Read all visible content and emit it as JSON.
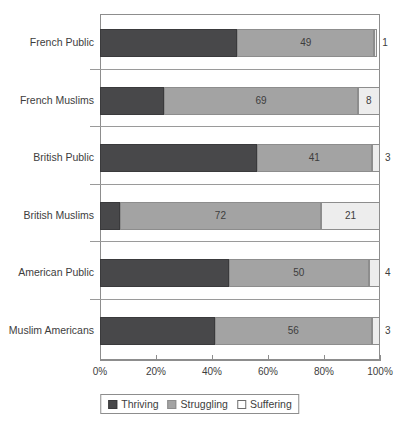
{
  "chart_data": {
    "type": "bar",
    "orientation": "horizontal",
    "stacked": true,
    "normalized_percent": true,
    "title": "",
    "subtitle": "",
    "xlabel": "",
    "ylabel": "",
    "xlim": [
      0,
      100
    ],
    "grid": false,
    "legend_position": "bottom",
    "categories": [
      "French Public",
      "French Muslims",
      "British Public",
      "British Muslims",
      "American Public",
      "Muslim Americans"
    ],
    "series": [
      {
        "name": "Thriving",
        "color": "#48484a",
        "values": [
          49,
          23,
          56,
          7,
          46,
          41
        ]
      },
      {
        "name": "Struggling",
        "color": "#a3a3a3",
        "values": [
          49,
          69,
          41,
          72,
          50,
          56
        ]
      },
      {
        "name": "Suffering",
        "color": "#ededed",
        "values": [
          1,
          8,
          3,
          21,
          4,
          3
        ]
      }
    ],
    "data_labels": {
      "French Public": {
        "Thriving": "",
        "Struggling": "49",
        "Suffering": "1"
      },
      "French Muslims": {
        "Thriving": "",
        "Struggling": "69",
        "Suffering": "8"
      },
      "British Public": {
        "Thriving": "",
        "Struggling": "41",
        "Suffering": "3"
      },
      "British Muslims": {
        "Thriving": "",
        "Struggling": "72",
        "Suffering": "21"
      },
      "American Public": {
        "Thriving": "",
        "Struggling": "50",
        "Suffering": "4"
      },
      "Muslim Americans": {
        "Thriving": "",
        "Struggling": "56",
        "Suffering": "3"
      }
    },
    "xticks": [
      0,
      20,
      40,
      60,
      80,
      100
    ],
    "xticklabels": [
      "0%",
      "20%",
      "40%",
      "60%",
      "80%",
      "100%"
    ]
  },
  "legend": {
    "items": [
      {
        "label": "Thriving",
        "swatch": "thriving-swatch"
      },
      {
        "label": "Struggling",
        "swatch": "struggling-swatch"
      },
      {
        "label": "Suffering",
        "swatch": "suffering-swatch"
      }
    ]
  },
  "colors": {
    "thriving": "#48484a",
    "struggling": "#a3a3a3",
    "suffering": "#ededed",
    "axis": "#8d8d8d",
    "text": "#3d3d3d",
    "background": "#ffffff"
  }
}
